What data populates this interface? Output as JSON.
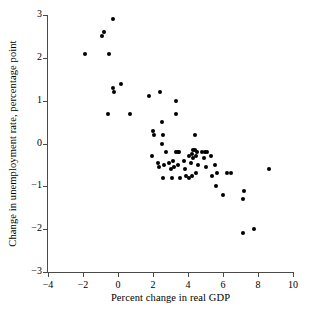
{
  "chart_data": {
    "type": "scatter",
    "title": "",
    "xlabel": "Percent change in real GDP",
    "ylabel": "Change in unemployment rate, percentage point",
    "xlim": [
      -4,
      10
    ],
    "ylim": [
      -3,
      3
    ],
    "xticks": [
      -4,
      -2,
      0,
      2,
      4,
      6,
      8,
      10
    ],
    "xtick_labels": [
      "−4",
      "−2",
      "0",
      "2",
      "4",
      "6",
      "8",
      "10"
    ],
    "yticks": [
      -3,
      -2,
      -1,
      0,
      1,
      2,
      3
    ],
    "ytick_labels": [
      "−3",
      "−2",
      "−1",
      "0",
      "1",
      "2",
      "3"
    ],
    "grid": false,
    "legend": false,
    "marker": {
      "shape": "circle",
      "color": "#000000",
      "size_px": 4
    },
    "axis_color": "#4a4a4a",
    "background": "#ffffff",
    "n_points": 68,
    "points": [
      {
        "x": -1.9,
        "y": 2.1
      },
      {
        "x": -0.9,
        "y": 2.5
      },
      {
        "x": -0.8,
        "y": 2.6
      },
      {
        "x": -0.3,
        "y": 2.9
      },
      {
        "x": -0.5,
        "y": 2.1
      },
      {
        "x": -0.6,
        "y": 0.7
      },
      {
        "x": -0.3,
        "y": 1.3
      },
      {
        "x": -0.25,
        "y": 1.2
      },
      {
        "x": 0.15,
        "y": 1.4
      },
      {
        "x": 0.7,
        "y": 0.7
      },
      {
        "x": 1.75,
        "y": 1.1
      },
      {
        "x": 2.4,
        "y": 1.2
      },
      {
        "x": 3.3,
        "y": 1.0
      },
      {
        "x": 3.3,
        "y": 0.7
      },
      {
        "x": 2.5,
        "y": 0.5
      },
      {
        "x": 2.0,
        "y": 0.3
      },
      {
        "x": 2.05,
        "y": 0.2
      },
      {
        "x": 2.55,
        "y": 0.2
      },
      {
        "x": 2.5,
        "y": 0.0
      },
      {
        "x": 4.4,
        "y": 0.2
      },
      {
        "x": 1.95,
        "y": -0.3
      },
      {
        "x": 2.3,
        "y": -0.45
      },
      {
        "x": 2.35,
        "y": -0.55
      },
      {
        "x": 2.6,
        "y": -0.5
      },
      {
        "x": 2.75,
        "y": -0.2
      },
      {
        "x": 2.9,
        "y": -0.45
      },
      {
        "x": 2.55,
        "y": -0.8
      },
      {
        "x": 3.0,
        "y": -0.6
      },
      {
        "x": 3.15,
        "y": -0.4
      },
      {
        "x": 3.3,
        "y": -0.2
      },
      {
        "x": 3.4,
        "y": -0.2
      },
      {
        "x": 3.5,
        "y": -0.2
      },
      {
        "x": 3.45,
        "y": -0.5
      },
      {
        "x": 3.2,
        "y": -0.55
      },
      {
        "x": 3.1,
        "y": -0.8
      },
      {
        "x": 3.55,
        "y": -0.8
      },
      {
        "x": 3.75,
        "y": -0.4
      },
      {
        "x": 3.8,
        "y": -0.6
      },
      {
        "x": 3.9,
        "y": -0.75
      },
      {
        "x": 4.05,
        "y": -0.8
      },
      {
        "x": 4.05,
        "y": -0.3
      },
      {
        "x": 4.2,
        "y": -0.25
      },
      {
        "x": 4.3,
        "y": -0.15
      },
      {
        "x": 4.4,
        "y": -0.15
      },
      {
        "x": 4.5,
        "y": -0.2
      },
      {
        "x": 4.45,
        "y": -0.3
      },
      {
        "x": 4.3,
        "y": -0.35
      },
      {
        "x": 4.15,
        "y": -0.45
      },
      {
        "x": 4.55,
        "y": -0.5
      },
      {
        "x": 4.45,
        "y": -0.7
      },
      {
        "x": 4.2,
        "y": -0.75
      },
      {
        "x": 4.8,
        "y": -0.2
      },
      {
        "x": 4.95,
        "y": -0.2
      },
      {
        "x": 4.9,
        "y": -0.35
      },
      {
        "x": 5.1,
        "y": -0.2
      },
      {
        "x": 5.0,
        "y": -0.55
      },
      {
        "x": 5.3,
        "y": -0.3
      },
      {
        "x": 5.35,
        "y": -0.75
      },
      {
        "x": 5.55,
        "y": -0.5
      },
      {
        "x": 5.6,
        "y": -1.0
      },
      {
        "x": 5.65,
        "y": -0.7
      },
      {
        "x": 6.0,
        "y": -1.2
      },
      {
        "x": 6.2,
        "y": -0.7
      },
      {
        "x": 6.45,
        "y": -0.7
      },
      {
        "x": 7.15,
        "y": -1.3
      },
      {
        "x": 7.15,
        "y": -2.1
      },
      {
        "x": 7.2,
        "y": -1.1
      },
      {
        "x": 7.75,
        "y": -2.0
      },
      {
        "x": 8.65,
        "y": -0.6
      }
    ]
  }
}
